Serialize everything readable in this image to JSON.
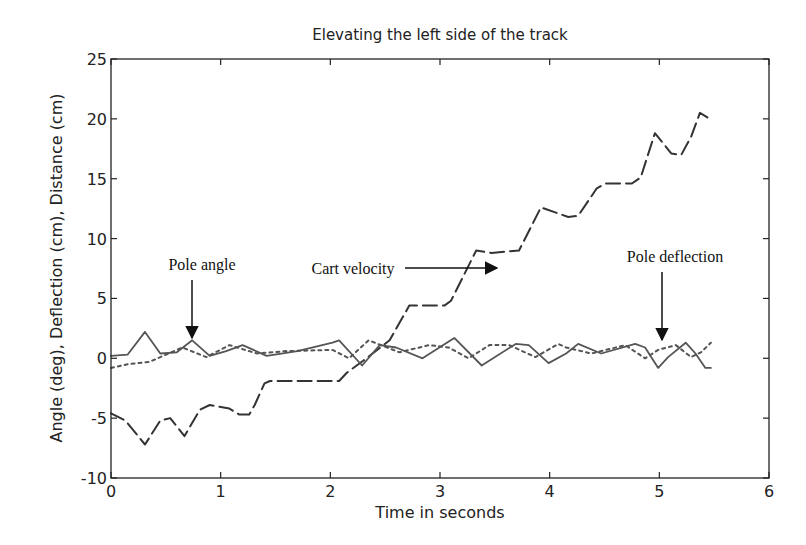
{
  "chart_data": {
    "type": "line",
    "title": "Elevating the left side of the track",
    "xlabel": "Time in seconds",
    "ylabel": "Angle (deg),  Deflection (cm),  Distance (cm)",
    "xlim": [
      0,
      6
    ],
    "ylim": [
      -10,
      25
    ],
    "xticks": [
      0,
      1,
      2,
      3,
      4,
      5,
      6
    ],
    "yticks": [
      -10,
      -5,
      0,
      5,
      10,
      15,
      20,
      25
    ],
    "grid": false,
    "legend": null,
    "annotations": [
      {
        "text": "Pole angle",
        "arrow": "down",
        "target_x": 0.74,
        "target_y": 1.5
      },
      {
        "text": "Cart velocity",
        "arrow": "right",
        "target_x": 3.52,
        "target_y": 7.5
      },
      {
        "text": "Pole deflection",
        "arrow": "down",
        "target_x": 5.0,
        "target_y": 1.0
      }
    ],
    "series": [
      {
        "name": "Distance (cart)",
        "style": "dashed",
        "x": [
          0,
          0.13,
          0.31,
          0.45,
          0.54,
          0.67,
          0.81,
          0.9,
          1.08,
          1.17,
          1.26,
          1.31,
          1.4,
          1.45,
          1.8,
          2.08,
          2.15,
          2.3,
          2.54,
          2.72,
          2.85,
          3.04,
          3.1,
          3.33,
          3.47,
          3.72,
          3.92,
          4.17,
          4.26,
          4.43,
          4.51,
          4.75,
          4.83,
          4.96,
          5.11,
          5.2,
          5.29,
          5.37,
          5.46
        ],
        "y": [
          -4.6,
          -5.2,
          -7.2,
          -5.2,
          -5.0,
          -6.5,
          -4.3,
          -3.9,
          -4.2,
          -4.7,
          -4.7,
          -3.9,
          -2.1,
          -1.9,
          -1.9,
          -1.9,
          -1.2,
          -0.2,
          1.5,
          4.4,
          4.4,
          4.4,
          4.8,
          9.0,
          8.8,
          9.0,
          12.6,
          11.8,
          11.9,
          14.2,
          14.6,
          14.6,
          15.1,
          18.8,
          17.1,
          17.0,
          18.5,
          20.5,
          20.0
        ]
      },
      {
        "name": "Pole angle",
        "style": "solid",
        "x": [
          0,
          0.15,
          0.31,
          0.45,
          0.6,
          0.74,
          0.9,
          1.05,
          1.2,
          1.42,
          1.7,
          2.02,
          2.08,
          2.29,
          2.45,
          2.6,
          2.84,
          3.13,
          3.38,
          3.69,
          3.81,
          3.99,
          4.15,
          4.26,
          4.47,
          4.78,
          4.87,
          4.99,
          5.08,
          5.24,
          5.33,
          5.42,
          5.47
        ],
        "y": [
          0.2,
          0.3,
          2.2,
          0.4,
          0.5,
          1.5,
          0.2,
          0.6,
          1.1,
          0.2,
          0.6,
          1.3,
          1.5,
          -0.6,
          1.1,
          0.9,
          0.0,
          1.7,
          -0.6,
          1.2,
          1.1,
          -0.4,
          0.4,
          1.2,
          0.4,
          1.2,
          0.9,
          -0.8,
          0.1,
          1.3,
          0.4,
          -0.8,
          -0.8
        ]
      },
      {
        "name": "Pole deflection",
        "style": "dotted",
        "x": [
          0,
          0.15,
          0.35,
          0.65,
          0.87,
          1.08,
          1.33,
          1.6,
          2.02,
          2.17,
          2.35,
          2.63,
          2.9,
          3.08,
          3.26,
          3.45,
          3.63,
          3.87,
          4.08,
          4.15,
          4.38,
          4.69,
          4.87,
          4.99,
          5.15,
          5.29,
          5.38,
          5.47
        ],
        "y": [
          -0.8,
          -0.5,
          -0.3,
          0.9,
          0.1,
          1.1,
          0.4,
          0.6,
          0.7,
          0.0,
          1.5,
          0.5,
          1.1,
          0.9,
          0.0,
          1.1,
          1.1,
          0.1,
          1.2,
          0.9,
          0.4,
          1.1,
          0.0,
          0.7,
          1.1,
          0.1,
          0.5,
          1.3
        ]
      }
    ]
  },
  "labels": {
    "title": "Elevating the left side of the track",
    "xlabel": "Time in seconds",
    "ylabel": "Angle (deg),  Deflection (cm),  Distance (cm)",
    "annot_pole_angle": "Pole angle",
    "annot_cart_velocity": "Cart velocity",
    "annot_pole_deflection": "Pole deflection"
  }
}
